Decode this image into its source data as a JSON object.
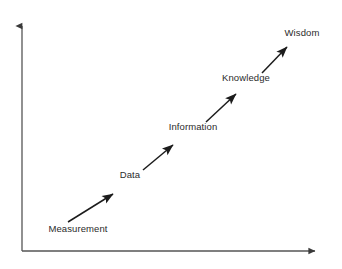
{
  "diagram": {
    "type": "arrow-progression",
    "canvas": {
      "width": 342,
      "height": 269
    },
    "colors": {
      "background": "#ffffff",
      "axis": "#555555",
      "arrow": "#1c1c1c",
      "label_text": "#2b2b2b"
    },
    "axes": {
      "origin": {
        "x": 22,
        "y": 251
      },
      "y_axis": {
        "name": "vertical-axis",
        "x": 22,
        "y_top": 19,
        "y_bottom": 251,
        "arrowhead": "up",
        "label": ""
      },
      "x_axis": {
        "name": "horizontal-axis",
        "y": 251,
        "x_left": 22,
        "x_right": 322,
        "arrowhead": "right",
        "label": ""
      }
    },
    "stages": [
      {
        "id": "measurement",
        "label": "Measurement",
        "label_x": 78,
        "label_y": 229,
        "arrow": {
          "x1": 68,
          "y1": 222,
          "x2": 113,
          "y2": 194
        }
      },
      {
        "id": "data",
        "label": "Data",
        "label_x": 130,
        "label_y": 175,
        "arrow": {
          "x1": 143,
          "y1": 170,
          "x2": 173,
          "y2": 145
        }
      },
      {
        "id": "information",
        "label": "Information",
        "label_x": 193,
        "label_y": 127,
        "arrow": {
          "x1": 206,
          "y1": 122,
          "x2": 236,
          "y2": 94
        }
      },
      {
        "id": "knowledge",
        "label": "Knowledge",
        "label_x": 246,
        "label_y": 78,
        "arrow": {
          "x1": 262,
          "y1": 73,
          "x2": 287,
          "y2": 47
        }
      },
      {
        "id": "wisdom",
        "label": "Wisdom",
        "label_x": 302,
        "label_y": 33,
        "arrow": null
      }
    ]
  }
}
